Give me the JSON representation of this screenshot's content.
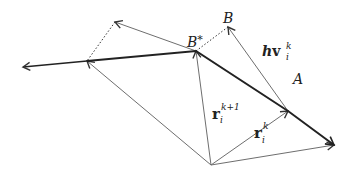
{
  "diagram": {
    "colors": {
      "thin_line": "#6e6e6e",
      "thick_line": "#222222",
      "text": "#222222",
      "background": "#ffffff"
    },
    "points": {
      "O": [
        211,
        165
      ],
      "left_tip": [
        23,
        67
      ],
      "P1": [
        87,
        61
      ],
      "D1": [
        115,
        22
      ],
      "B_star": [
        196,
        51
      ],
      "B": [
        228,
        27
      ],
      "A": [
        288,
        111
      ],
      "right_tip": [
        334,
        145
      ]
    },
    "labels": {
      "B": "B",
      "B_star": "B",
      "B_star_sup": "*",
      "A": "A",
      "hv_h": "h",
      "hv_v": "v",
      "hv_sub": "i",
      "hv_sup": "k",
      "r_k1_r": "r",
      "r_k1_sub": "i",
      "r_k1_sup": "k+1",
      "r_k_r": "r",
      "r_k_sub": "i",
      "r_k_sup": "k"
    }
  }
}
